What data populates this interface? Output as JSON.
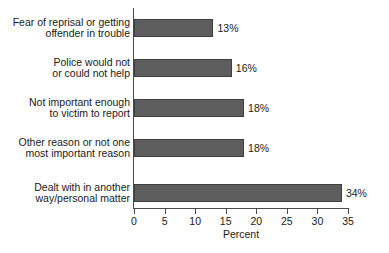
{
  "chart_data": {
    "type": "bar",
    "orientation": "horizontal",
    "title": "",
    "xlabel": "Percent",
    "ylabel": "",
    "xlim": [
      0,
      35
    ],
    "xticks": [
      0,
      5,
      10,
      15,
      20,
      25,
      30,
      35
    ],
    "grid": false,
    "legend": false,
    "bar_color": "#5e5e5e",
    "categories": [
      "Fear of reprisal or getting offender in trouble",
      "Police would not or could not help",
      "Not important enough to victim to report",
      "Other reason or not one most important reason",
      "Dealt with in another way/personal matter"
    ],
    "category_lines": [
      [
        "Fear of reprisal or getting",
        "offender in trouble"
      ],
      [
        "Police would not",
        "or could not help"
      ],
      [
        "Not important enough",
        "to victim to report"
      ],
      [
        "Other reason or not one",
        "most important reason"
      ],
      [
        "Dealt with in another",
        "way/personal matter"
      ]
    ],
    "values": [
      13,
      16,
      18,
      18,
      34
    ],
    "value_labels": [
      "13%",
      "16%",
      "18%",
      "18%",
      "34%"
    ]
  },
  "axis": {
    "x_title": "Percent",
    "tick_labels": [
      "0",
      "5",
      "10",
      "15",
      "20",
      "25",
      "30",
      "35"
    ]
  },
  "footer": {
    "cut_off_source_line": ""
  }
}
